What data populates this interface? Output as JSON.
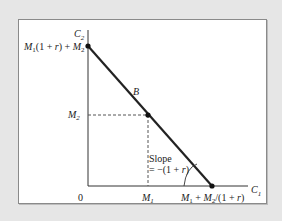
{
  "diagram": {
    "type": "intertemporal-budget-line",
    "axes": {
      "y_label": "C2",
      "x_label": "C1",
      "origin_label": "0"
    },
    "labels": {
      "y_intercept": "M1(1 + r) + M2",
      "endowment_y": "M2",
      "endowment_x": "M1",
      "x_intercept": "M1 + M2/(1 + r)",
      "point": "B",
      "slope_line1": "Slope",
      "slope_line2": "= −(1 + r)"
    },
    "points": [
      {
        "name": "y-intercept",
        "x": 88,
        "y": 46
      },
      {
        "name": "endowment-B",
        "x": 148,
        "y": 115
      },
      {
        "name": "x-intercept",
        "x": 212,
        "y": 186
      }
    ],
    "colors": {
      "background": "#e6e6e6",
      "panel": "#ffffff",
      "line": "#222222",
      "dashed": "#555555"
    }
  }
}
